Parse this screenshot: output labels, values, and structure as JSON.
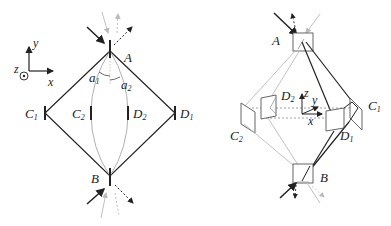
{
  "colors": {
    "dark": "#222222",
    "light": "#aaaaaa",
    "lighter": "#c8c8c8"
  },
  "left_diagram": {
    "axes": {
      "x": "x",
      "y": "y",
      "z": "z"
    },
    "nodes": {
      "A": {
        "label": "A"
      },
      "B": {
        "label": "B"
      },
      "C1": {
        "label": "C",
        "sub": "1"
      },
      "C2": {
        "label": "C",
        "sub": "2"
      },
      "D1": {
        "label": "D",
        "sub": "1"
      },
      "D2": {
        "label": "D",
        "sub": "2"
      }
    },
    "angles": [
      {
        "label": "a",
        "sub": "1"
      },
      {
        "label": "a",
        "sub": "2"
      }
    ]
  },
  "right_diagram": {
    "axes": {
      "x": "x",
      "y": "y",
      "z": "z"
    },
    "nodes": {
      "A": {
        "label": "A"
      },
      "B": {
        "label": "B"
      },
      "C1": {
        "label": "C",
        "sub": "1"
      },
      "C2": {
        "label": "C",
        "sub": "2"
      },
      "D1": {
        "label": "D",
        "sub": "1"
      },
      "D2": {
        "label": "D",
        "sub": "2"
      }
    }
  }
}
